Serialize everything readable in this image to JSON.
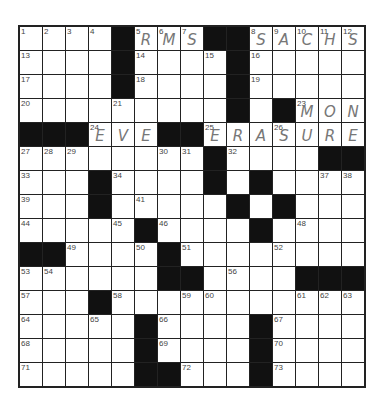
{
  "puzzle": {
    "rows": 15,
    "cols": 15,
    "layout": [
      "....#...##.....",
      "....#....#.....",
      "....#....#.....",
      ".........#.#...",
      "###...##.......",
      "........#....##",
      "...#....#.#....",
      "...#.....#.#...",
      ".....#....#....",
      "##....#........",
      "......##....###",
      "...#...........",
      ".....#....#....",
      ".....#....#....",
      ".....##...#...."
    ],
    "numbers": {
      "0,0": "1",
      "0,1": "2",
      "0,2": "3",
      "0,3": "4",
      "0,5": "5",
      "0,6": "6",
      "0,7": "7",
      "0,10": "8",
      "0,11": "9",
      "0,12": "10",
      "0,13": "11",
      "0,14": "12",
      "1,0": "13",
      "1,5": "14",
      "1,8": "15",
      "1,10": "16",
      "2,0": "17",
      "2,5": "18",
      "2,10": "19",
      "3,0": "20",
      "3,4": "21",
      "3,9": "22",
      "3,12": "23",
      "4,3": "24",
      "4,8": "25",
      "4,11": "26",
      "5,0": "27",
      "5,1": "28",
      "5,2": "29",
      "5,6": "30",
      "5,7": "31",
      "5,9": "32",
      "6,0": "33",
      "6,4": "34",
      "6,8": "35",
      "6,10": "36",
      "6,13": "37",
      "6,14": "38",
      "7,0": "39",
      "7,3": "40",
      "7,5": "41",
      "7,9": "42",
      "7,11": "43",
      "8,0": "44",
      "8,4": "45",
      "8,6": "46",
      "8,10": "47",
      "8,12": "48",
      "9,2": "49",
      "9,5": "50",
      "9,7": "51",
      "9,11": "52",
      "10,0": "53",
      "10,1": "54",
      "10,6": "55",
      "10,9": "56",
      "11,0": "57",
      "11,4": "58",
      "11,7": "59",
      "11,8": "60",
      "11,12": "61",
      "11,13": "62",
      "11,14": "63",
      "12,0": "64",
      "12,3": "65",
      "12,6": "66",
      "12,11": "67",
      "13,0": "68",
      "13,6": "69",
      "13,11": "70",
      "14,0": "71",
      "14,7": "72",
      "14,11": "73"
    },
    "filled": {
      "0,5": "R",
      "0,6": "M",
      "0,7": "S",
      "0,10": "S",
      "0,11": "A",
      "0,12": "C",
      "0,13": "H",
      "0,14": "S",
      "3,12": "M",
      "3,13": "O",
      "3,14": "N",
      "4,3": "E",
      "4,4": "V",
      "4,5": "E",
      "4,8": "E",
      "4,9": "R",
      "4,10": "A",
      "4,11": "S",
      "4,12": "U",
      "4,13": "R",
      "4,14": "E"
    },
    "entries": [
      {
        "clue": "5-Across",
        "answer": "RMS"
      },
      {
        "clue": "8-Across",
        "answer": "SACHS"
      },
      {
        "clue": "23-Across",
        "answer": "MON"
      },
      {
        "clue": "24-Across",
        "answer": "EVE"
      },
      {
        "clue": "25-Across",
        "answer": "ERASURE"
      }
    ]
  }
}
